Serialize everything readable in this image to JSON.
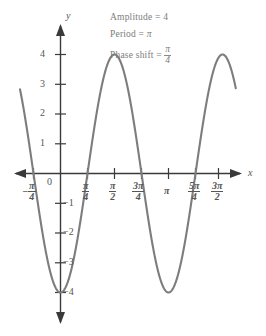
{
  "figure": {
    "kind": "trigonometric-graph",
    "curve_color": "#7d7d7d",
    "axis_color": "#3a3a3a",
    "text_color": "#6e6e6e"
  },
  "annotations": {
    "amplitude": {
      "prefix": "Amplitude = ",
      "value": "4"
    },
    "period": {
      "prefix": "Period = ",
      "value": "π"
    },
    "phase_shift": {
      "prefix": "Phase shift = ",
      "numerator": "π",
      "denominator": "4"
    }
  },
  "axes": {
    "x_label": "x",
    "y_label": "y",
    "origin_label": "0"
  },
  "y_ticks": [
    {
      "label": "4",
      "value": 4
    },
    {
      "label": "3",
      "value": 3
    },
    {
      "label": "2",
      "value": 2
    },
    {
      "label": "1",
      "value": 1
    },
    {
      "label": "−1",
      "value": -1
    },
    {
      "label": "−2",
      "value": -2
    },
    {
      "label": "−3",
      "value": -3
    },
    {
      "label": "−4",
      "value": -4
    }
  ],
  "x_ticks": [
    {
      "numerator": "π",
      "denominator": "4",
      "sign": "−",
      "value": -0.7854,
      "label": "-π/4"
    },
    {
      "numerator": "π",
      "denominator": "4",
      "sign": "",
      "value": 0.7854,
      "label": "π/4"
    },
    {
      "numerator": "π",
      "denominator": "2",
      "sign": "",
      "value": 1.5708,
      "label": "π/2"
    },
    {
      "numerator": "3π",
      "denominator": "4",
      "sign": "",
      "value": 2.3562,
      "label": "3π/4"
    },
    {
      "numerator": "π",
      "denominator": "",
      "sign": "",
      "value": 3.1416,
      "label": "π"
    },
    {
      "numerator": "5π",
      "denominator": "4",
      "sign": "",
      "value": 3.927,
      "label": "5π/4"
    },
    {
      "numerator": "3π",
      "denominator": "2",
      "sign": "",
      "value": 4.7124,
      "label": "3π/2"
    }
  ],
  "chart_data": {
    "type": "line",
    "title": "",
    "xlabel": "x",
    "ylabel": "y",
    "function": "y = 4 sin(2(x - π/4))",
    "amplitude": 4,
    "period": 3.1416,
    "phase_shift": 0.7854,
    "xlim": [
      -1.1781,
      5.1051
    ],
    "ylim": [
      -4.6,
      4.6
    ],
    "grid": false,
    "legend": "none",
    "xtick_labels": [
      "-π/4",
      "0",
      "π/4",
      "π/2",
      "3π/4",
      "π",
      "5π/4",
      "3π/2"
    ],
    "xtick_values": [
      -0.7854,
      0,
      0.7854,
      1.5708,
      2.3562,
      3.1416,
      3.927,
      4.7124
    ],
    "ytick_labels": [
      "4",
      "3",
      "2",
      "1",
      "-1",
      "-2",
      "-3",
      "-4"
    ],
    "ytick_values": [
      4,
      3,
      2,
      1,
      -1,
      -2,
      -3,
      -4
    ],
    "key_points": [
      {
        "x": 0,
        "y": 0,
        "kind": "zero-rising"
      },
      {
        "x": 0.7854,
        "y": 4,
        "kind": "maximum"
      },
      {
        "x": 1.5708,
        "y": 0,
        "kind": "zero-falling"
      },
      {
        "x": 2.3562,
        "y": -4,
        "kind": "minimum"
      },
      {
        "x": 3.1416,
        "y": 0,
        "kind": "zero-rising"
      },
      {
        "x": 3.927,
        "y": 4,
        "kind": "maximum"
      },
      {
        "x": 4.7124,
        "y": 0,
        "kind": "zero-falling"
      }
    ]
  }
}
